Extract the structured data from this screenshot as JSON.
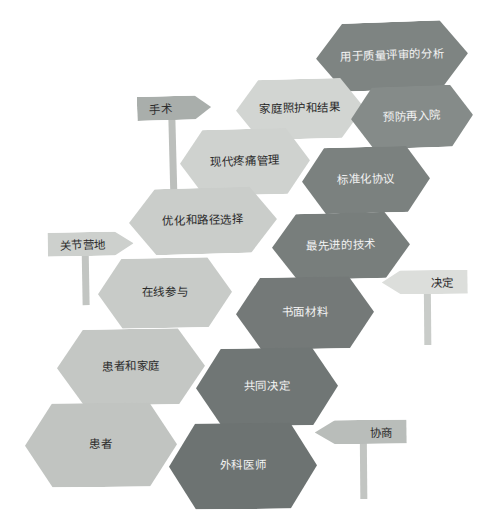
{
  "diagram": {
    "title": "",
    "background_color": "#ffffff",
    "palette": {
      "light_1": "#d7d9d6",
      "light_2": "#cfd2cf",
      "light_3": "#c6c9c6",
      "light_4": "#bfc3c0",
      "dark_1": "#8d9290",
      "dark_2": "#7f8583",
      "dark_3": "#767c7b",
      "dark_4": "#6e7473",
      "post_color": "#b9bdba",
      "text_dark": "#2b2b2b",
      "text_light": "#f2f2f2"
    },
    "hexagons": [
      {
        "id": "analysis-for-quality-review",
        "label": "用于质量评审的分析",
        "tone": "dark",
        "fill": "#7e8482",
        "x": 316,
        "y": 22,
        "w": 152,
        "h": 68,
        "rotate": -2.0
      },
      {
        "id": "home-care-and-outcomes",
        "label": "家庭照护和结果",
        "tone": "light",
        "fill": "#d2d5d2",
        "x": 236,
        "y": 79,
        "w": 128,
        "h": 60,
        "rotate": -1.5
      },
      {
        "id": "prevent-readmission",
        "label": "预防再入院",
        "tone": "dark",
        "fill": "#858b89",
        "x": 351,
        "y": 86,
        "w": 122,
        "h": 62,
        "rotate": -2.0
      },
      {
        "id": "modern-pain-management",
        "label": "现代疼痛管理",
        "tone": "light",
        "fill": "#cfd2cf",
        "x": 180,
        "y": 129,
        "w": 130,
        "h": 66,
        "rotate": -1.5
      },
      {
        "id": "standardized-protocol",
        "label": "标准化协议",
        "tone": "dark",
        "fill": "#7b817f",
        "x": 302,
        "y": 147,
        "w": 128,
        "h": 66,
        "rotate": -1.5
      },
      {
        "id": "optimization-and-pathway-selection",
        "label": "优化和路径选择",
        "tone": "light",
        "fill": "#cacdca",
        "x": 129,
        "y": 188,
        "w": 148,
        "h": 66,
        "rotate": -1.5
      },
      {
        "id": "state-of-the-art-technology",
        "label": "最先进的技术",
        "tone": "dark",
        "fill": "#787e7c",
        "x": 272,
        "y": 213,
        "w": 138,
        "h": 66,
        "rotate": -1.5
      },
      {
        "id": "online-participation",
        "label": "在线参与",
        "tone": "light",
        "fill": "#c8cbc8",
        "x": 98,
        "y": 258,
        "w": 134,
        "h": 70,
        "rotate": -1.0
      },
      {
        "id": "written-materials",
        "label": "书面材料",
        "tone": "dark",
        "fill": "#747978",
        "x": 236,
        "y": 277,
        "w": 138,
        "h": 72,
        "rotate": -1.0
      },
      {
        "id": "patient-and-family",
        "label": "患者和家庭",
        "tone": "light",
        "fill": "#c4c7c4",
        "x": 57,
        "y": 329,
        "w": 148,
        "h": 76,
        "rotate": -1.0
      },
      {
        "id": "shared-decision-making",
        "label": "共同决定",
        "tone": "dark",
        "fill": "#707675",
        "x": 196,
        "y": 348,
        "w": 142,
        "h": 78,
        "rotate": -1.0
      },
      {
        "id": "patient",
        "label": "患者",
        "tone": "light",
        "fill": "#c1c4c1",
        "x": 25,
        "y": 403,
        "w": 152,
        "h": 84,
        "rotate": -0.5
      },
      {
        "id": "surgeon",
        "label": "外科医师",
        "tone": "dark",
        "fill": "#6d7372",
        "x": 169,
        "y": 423,
        "w": 148,
        "h": 86,
        "rotate": -0.5
      }
    ],
    "signposts": [
      {
        "id": "surgery",
        "label": "手术",
        "direction": "right",
        "fill": "#a9aeab",
        "x": 138,
        "y": 96,
        "w": 74,
        "h": 24,
        "rotate": -1.5,
        "post": {
          "x": 31,
          "y": 23,
          "w": 7,
          "h": 70,
          "color": "#bcbfbc"
        }
      },
      {
        "id": "joint-camp",
        "label": "关节营地",
        "direction": "right",
        "fill": "#cdd0cd",
        "x": 48,
        "y": 232,
        "w": 86,
        "h": 24,
        "rotate": -1.0,
        "post": {
          "x": 34,
          "y": 23,
          "w": 7,
          "h": 50,
          "color": "#c2c5c2"
        }
      },
      {
        "id": "decision",
        "label": "决定",
        "direction": "left",
        "fill": "#dcdedb",
        "x": 382,
        "y": 270,
        "w": 86,
        "h": 24,
        "rotate": -0.5,
        "post": {
          "x": 42,
          "y": 23,
          "w": 7,
          "h": 52,
          "color": "#c9ccc9"
        }
      },
      {
        "id": "negotiation",
        "label": "协商",
        "direction": "left",
        "fill": "#b9bdba",
        "x": 315,
        "y": 420,
        "w": 92,
        "h": 24,
        "rotate": -0.5,
        "post": {
          "x": 45,
          "y": 23,
          "w": 7,
          "h": 56,
          "color": "#c2c5c2"
        }
      }
    ]
  }
}
